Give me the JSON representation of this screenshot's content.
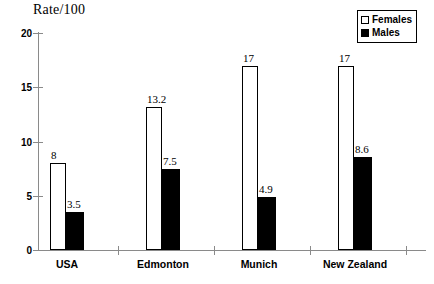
{
  "chart_data": {
    "type": "bar",
    "title": "Rate/100",
    "xlabel": "",
    "ylabel": "Rate/100",
    "ylim": [
      0,
      20
    ],
    "yticks": [
      0,
      5,
      10,
      15,
      20
    ],
    "grid": false,
    "legend_position": "top-right",
    "categories": [
      "USA",
      "Edmonton",
      "Munich",
      "New Zealand"
    ],
    "series": [
      {
        "name": "Females",
        "color": "#ffffff",
        "values": [
          8,
          13.2,
          17,
          17
        ],
        "labels": [
          "8",
          "13.2",
          "17",
          "17"
        ]
      },
      {
        "name": "Males",
        "color": "#000000",
        "values": [
          3.5,
          7.5,
          4.9,
          8.6
        ],
        "labels": [
          "3.5",
          "7.5",
          "4.9",
          "8.6"
        ]
      }
    ]
  },
  "legend": {
    "items": [
      {
        "label": "Females",
        "swatch": "hollow-square-icon"
      },
      {
        "label": "Males",
        "swatch": "filled-square-icon"
      }
    ]
  }
}
